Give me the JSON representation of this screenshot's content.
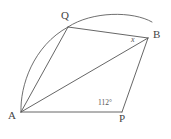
{
  "figure": {
    "background_color": "#ffffff",
    "stroke_color": "#555555",
    "width": 171,
    "height": 139
  },
  "vertices": [
    {
      "id": "A",
      "label": "A",
      "x": 21,
      "y": 112
    },
    {
      "id": "Q",
      "label": "Q",
      "x": 68,
      "y": 27
    },
    {
      "id": "B",
      "label": "B",
      "x": 148,
      "y": 38
    },
    {
      "id": "P",
      "label": "P",
      "x": 122,
      "y": 112
    }
  ],
  "segments": [
    {
      "name": "A-Q",
      "from": "A",
      "to": "Q"
    },
    {
      "name": "A-B",
      "from": "A",
      "to": "B"
    },
    {
      "name": "A-P",
      "from": "A",
      "to": "P"
    },
    {
      "name": "Q-B",
      "from": "Q",
      "to": "B"
    },
    {
      "name": "B-P",
      "from": "B",
      "to": "P"
    }
  ],
  "arcs": [
    {
      "name": "arc-A-Q",
      "from": "A",
      "to": "Q",
      "bulge": "left"
    },
    {
      "name": "arc-Q-B",
      "from": "Q",
      "to": "B",
      "bulge": "up"
    }
  ],
  "angle_labels": [
    {
      "name": "angle-at-B",
      "label": "x",
      "at_vertex": "B",
      "style": "italic"
    },
    {
      "name": "angle-at-P",
      "label": "112°",
      "at_vertex": "P"
    }
  ],
  "labels": {
    "a": "A",
    "q": "Q",
    "b": "B",
    "p": "P",
    "x": "x",
    "angle_p": "112°"
  }
}
